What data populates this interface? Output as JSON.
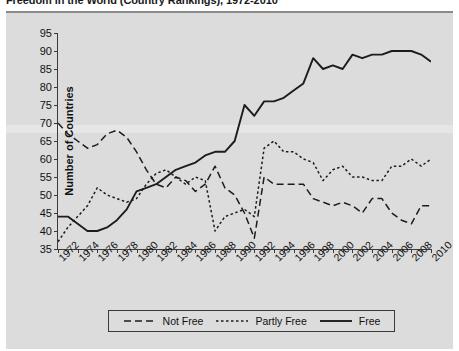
{
  "title": "Freedom in the World (Country Rankings), 1972-2010",
  "axes": {
    "ylabel": "Number of Countries",
    "yticks": [
      35,
      40,
      45,
      50,
      55,
      60,
      65,
      70,
      75,
      80,
      85,
      90,
      95
    ],
    "ylim": [
      35,
      95
    ],
    "xticks": [
      1972,
      1974,
      1976,
      1978,
      1980,
      1982,
      1984,
      1986,
      1988,
      1990,
      1992,
      1994,
      1996,
      1998,
      2000,
      2002,
      2004,
      2006,
      2008,
      2010
    ],
    "xlim": [
      1972,
      2010
    ]
  },
  "legend": {
    "position": "bottom-center",
    "items": [
      {
        "label": "Not Free",
        "style": "dashed",
        "swatch": "long-dash"
      },
      {
        "label": "Partly Free",
        "style": "dotted",
        "swatch": "short-dash"
      },
      {
        "label": "Free",
        "style": "solid",
        "swatch": "solid"
      }
    ]
  },
  "chart_data": {
    "type": "line",
    "title": "Freedom in the World (Country Rankings), 1972-2010",
    "xlabel": "",
    "ylabel": "Number of Countries",
    "ylim": [
      35,
      95
    ],
    "xlim": [
      1972,
      2010
    ],
    "grid": false,
    "x": [
      1972,
      1973,
      1974,
      1975,
      1976,
      1977,
      1978,
      1979,
      1980,
      1981,
      1982,
      1983,
      1984,
      1985,
      1986,
      1987,
      1988,
      1989,
      1990,
      1991,
      1992,
      1993,
      1994,
      1995,
      1996,
      1997,
      1998,
      1999,
      2000,
      2001,
      2002,
      2003,
      2004,
      2005,
      2006,
      2007,
      2008,
      2009,
      2010
    ],
    "series": [
      {
        "name": "Not Free",
        "style": "dashed",
        "values": [
          70,
          67,
          65,
          63,
          64,
          67,
          68,
          66,
          62,
          57,
          53,
          52,
          55,
          54,
          51,
          53,
          58,
          52,
          50,
          45,
          38,
          55,
          53,
          53,
          53,
          53,
          49,
          48,
          47,
          48,
          47,
          45,
          49,
          49,
          45,
          43,
          42,
          47,
          47
        ]
      },
      {
        "name": "Partly Free",
        "style": "dotted",
        "values": [
          37,
          41,
          44,
          47,
          52,
          50,
          49,
          48,
          49,
          53,
          56,
          57,
          55,
          53,
          55,
          54,
          40,
          44,
          45,
          46,
          44,
          63,
          65,
          62,
          62,
          60,
          59,
          54,
          57,
          58,
          55,
          55,
          54,
          54,
          58,
          58,
          60,
          58,
          60
        ]
      },
      {
        "name": "Free",
        "style": "solid",
        "values": [
          44,
          44,
          42,
          40,
          40,
          41,
          43,
          46,
          51,
          52,
          53,
          55,
          57,
          58,
          59,
          61,
          62,
          62,
          65,
          75,
          72,
          76,
          76,
          77,
          79,
          81,
          88,
          85,
          86,
          85,
          89,
          88,
          89,
          89,
          90,
          90,
          90,
          89,
          87
        ]
      }
    ]
  }
}
